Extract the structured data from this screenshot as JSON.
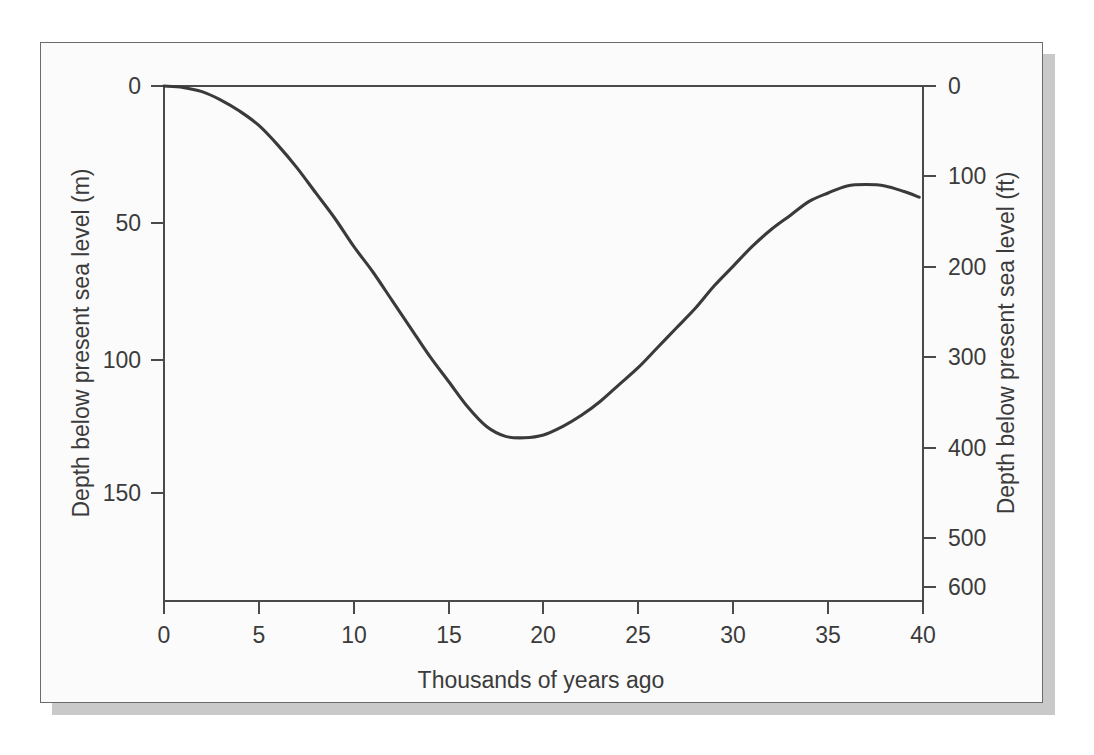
{
  "figure": {
    "background_color": "#fbfbfb",
    "page_background_color": "#ffffff",
    "frame_color": "#6b6b6b",
    "shadow_color": "#c9c9c9",
    "curve_color": "#3a3a3a",
    "axis_color": "#4a4a4a",
    "text_color": "#3b3b3b"
  },
  "chart_data": {
    "type": "line",
    "title": "",
    "subtitle": "",
    "xlabel": "Thousands of years ago",
    "ylabel": "Depth below present sea level (m)",
    "ylabel_secondary": "Depth below present sea level (ft)",
    "xlim": [
      0,
      40
    ],
    "ylim": [
      0,
      183
    ],
    "ylim_secondary": [
      0,
      600
    ],
    "x_inverted": false,
    "y_inverted": true,
    "grid": false,
    "legend": null,
    "x_ticks": [
      0,
      5,
      10,
      15,
      20,
      25,
      30,
      35,
      40
    ],
    "x_tick_labels": [
      "0",
      "5",
      "10",
      "15",
      "20",
      "25",
      "30",
      "35",
      "40"
    ],
    "y_ticks": [
      0,
      50,
      100,
      150
    ],
    "y_tick_labels": [
      "0",
      "50",
      "100",
      "150"
    ],
    "y_ticks_secondary": [
      0,
      100,
      200,
      300,
      400,
      500,
      600
    ],
    "y_tick_labels_secondary": [
      "0",
      "100",
      "200",
      "300",
      "400",
      "500",
      "600"
    ],
    "reference_lines": [
      {
        "axis": "y",
        "value": 0,
        "label": "present sea level"
      }
    ],
    "series": [
      {
        "name": "Sea level depth below present",
        "units_primary": "m",
        "units_secondary": "ft",
        "x": [
          0,
          1,
          2,
          3,
          4,
          5,
          6,
          7,
          8,
          9,
          10,
          11,
          12,
          13,
          14,
          15,
          16,
          17,
          18,
          19,
          20,
          21,
          22,
          23,
          24,
          25,
          26,
          27,
          28,
          29,
          30,
          31,
          32,
          33,
          34,
          35,
          36,
          37,
          38,
          39,
          39.8
        ],
        "values": [
          0,
          0.5,
          2,
          5,
          9,
          14,
          21,
          29,
          38,
          47,
          57,
          66,
          76,
          86,
          96,
          105,
          114,
          121,
          124.5,
          125,
          124,
          121,
          117,
          112,
          106,
          100,
          93,
          86,
          79,
          71,
          64,
          57,
          51,
          46,
          41,
          38,
          35.5,
          35,
          35.5,
          37.5,
          39.5
        ]
      }
    ],
    "annotations": [
      {
        "text": "maximum lowstand",
        "x": 17,
        "y": 125,
        "visible": false
      }
    ]
  },
  "axes": {
    "left_title": "Depth below present sea level (m)",
    "right_title": "Depth below present sea level (ft)",
    "bottom_title": "Thousands of years ago"
  }
}
